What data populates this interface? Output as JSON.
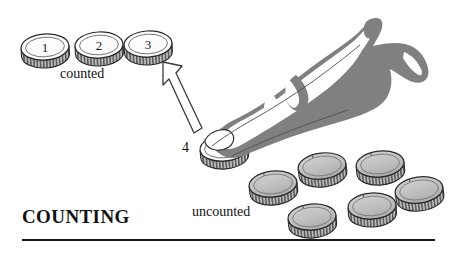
{
  "figure": {
    "title": "COUNTING",
    "width": 454,
    "height": 255,
    "background_color": "#ffffff",
    "ink_color": "#1a1a1a",
    "hand_fill_color": "#808080",
    "coin_counted_face_color": "#ffffff",
    "coin_uncounted_face_color": "#c0c0c0",
    "coin_rim_color": "#6e6e6e"
  },
  "labels": {
    "counted": "counted",
    "uncounted": "uncounted",
    "current_coin_number": "4"
  },
  "counted_coins": [
    {
      "number": "1",
      "cx": 45,
      "cy": 47
    },
    {
      "number": "2",
      "cx": 99,
      "cy": 45
    },
    {
      "number": "3",
      "cx": 148,
      "cy": 44
    }
  ],
  "current_coin": {
    "number": "4",
    "cx": 224,
    "cy": 148
  },
  "uncounted_coins": [
    {
      "cx": 273,
      "cy": 184
    },
    {
      "cx": 322,
      "cy": 166
    },
    {
      "cx": 312,
      "cy": 217
    },
    {
      "cx": 380,
      "cy": 164
    },
    {
      "cx": 372,
      "cy": 206
    },
    {
      "cx": 419,
      "cy": 190
    }
  ],
  "arrow": {
    "name": "move-to-counted-arrow",
    "direction": "up-left",
    "from_x": 201,
    "from_y": 133,
    "to_x": 163,
    "to_y": 62
  },
  "hand": {
    "name": "pointing-hand",
    "description": "hand with index finger pressing coin 4"
  }
}
